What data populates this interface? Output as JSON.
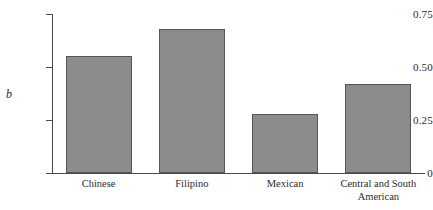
{
  "chart_data": {
    "type": "bar",
    "title": "",
    "xlabel": "",
    "ylabel": "b",
    "categories": [
      "Chinese",
      "Filipino",
      "Mexican",
      "Central and South\nAmerican"
    ],
    "values": [
      0.55,
      0.68,
      0.28,
      0.42
    ],
    "ylim": [
      0,
      0.75
    ],
    "yticks": [
      0,
      0.25,
      0.5,
      0.75
    ],
    "ytick_labels": [
      "0",
      "0.25",
      "0.50",
      "0.75"
    ],
    "grid": false,
    "legend": null,
    "bar_color": "#8c8c8c",
    "bar_edge_color": "#555555",
    "axis_color": "#4a4a4a",
    "background": "#ffffff"
  },
  "axis": {
    "y_title": "b"
  }
}
